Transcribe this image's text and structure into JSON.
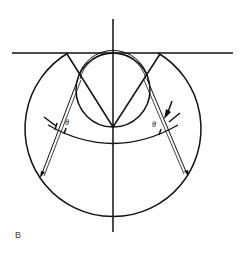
{
  "figure": {
    "panel_label": "B",
    "angle_labels": [
      "θ",
      "θ"
    ],
    "stroke_color": "#111111",
    "background": "#ffffff"
  }
}
